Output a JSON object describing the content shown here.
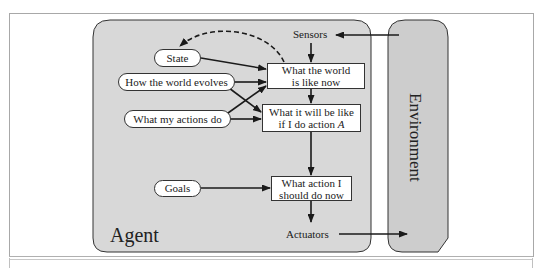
{
  "diagram": {
    "type": "model-based goal-based agent",
    "agent": {
      "label": "Agent"
    },
    "environment": {
      "label": "Environment"
    },
    "ovals": {
      "state": "State",
      "world_evolves": "How the world evolves",
      "actions_do": "What my actions do",
      "goals": "Goals"
    },
    "boxes": {
      "world_now_line1": "What the world",
      "world_now_line2": "is like now",
      "will_be_line1": "What it will be like",
      "will_be_line2_prefix": "if I do action ",
      "will_be_line2_var": "A",
      "action_line1": "What action I",
      "action_line2": "should do now"
    },
    "io": {
      "sensors": "Sensors",
      "actuators": "Actuators"
    },
    "colors": {
      "agent_fill": "#d8d8d8",
      "environment_fill": "#cdcdcd",
      "stroke": "#1a1a1a",
      "box_fill": "#ffffff"
    },
    "edges": [
      {
        "from": "Environment",
        "to": "Sensors"
      },
      {
        "from": "Sensors",
        "to": "What the world is like now"
      },
      {
        "from": "State",
        "to": "What the world is like now"
      },
      {
        "from": "How the world evolves",
        "to": "What the world is like now"
      },
      {
        "from": "How the world evolves",
        "to": "What it will be like if I do action A"
      },
      {
        "from": "What my actions do",
        "to": "What the world is like now"
      },
      {
        "from": "What my actions do",
        "to": "What it will be like if I do action A"
      },
      {
        "from": "What the world is like now",
        "to": "What it will be like if I do action A"
      },
      {
        "from": "What the world is like now",
        "to": "State",
        "style": "dashed"
      },
      {
        "from": "What it will be like if I do action A",
        "to": "What action I should do now"
      },
      {
        "from": "Goals",
        "to": "What action I should do now"
      },
      {
        "from": "What action I should do now",
        "to": "Actuators"
      },
      {
        "from": "Actuators",
        "to": "Environment"
      }
    ]
  }
}
